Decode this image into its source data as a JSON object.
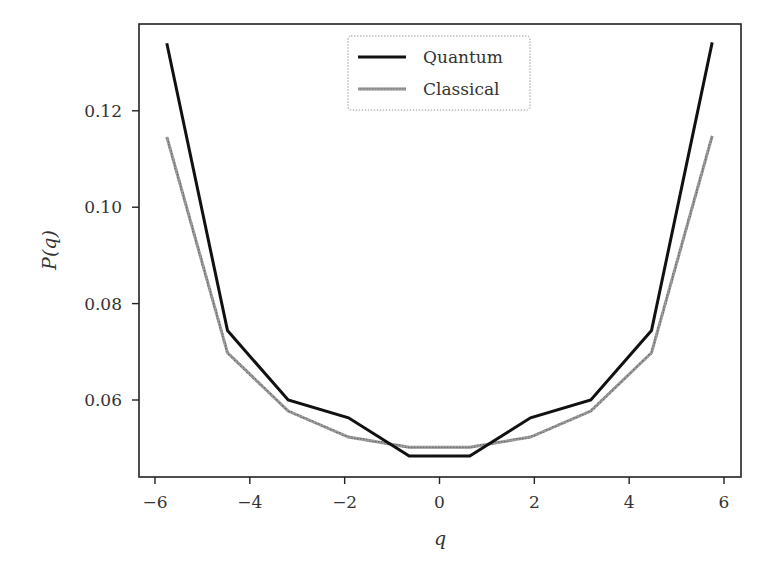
{
  "chart_data": {
    "type": "line",
    "title": "",
    "xlabel": "q",
    "ylabel": "P(q)",
    "xlim": [
      -6.3,
      6.4
    ],
    "ylim": [
      0.0455,
      0.1395
    ],
    "grid": false,
    "legend_position": "upper center",
    "x": [
      -5.75,
      -4.47,
      -3.19,
      -1.92,
      -0.64,
      0.64,
      1.92,
      3.19,
      4.47,
      5.75
    ],
    "series": [
      {
        "name": "Quantum",
        "color": "#111111",
        "style": "solid",
        "values": [
          0.134,
          0.0744,
          0.06,
          0.0563,
          0.0484,
          0.0484,
          0.0563,
          0.06,
          0.0744,
          0.1342
        ]
      },
      {
        "name": "Classical",
        "color": "#888888",
        "style": "hatched-gray",
        "values": [
          0.1146,
          0.0698,
          0.0577,
          0.0523,
          0.0502,
          0.0502,
          0.0523,
          0.0577,
          0.0698,
          0.1148
        ]
      }
    ],
    "x_ticks": [
      {
        "value": -6,
        "label": "−6"
      },
      {
        "value": -4,
        "label": "−4"
      },
      {
        "value": -2,
        "label": "−2"
      },
      {
        "value": 0,
        "label": "0"
      },
      {
        "value": 2,
        "label": "2"
      },
      {
        "value": 4,
        "label": "4"
      },
      {
        "value": 6,
        "label": "6"
      }
    ],
    "y_ticks": [
      {
        "value": 0.06,
        "label": "0.06"
      },
      {
        "value": 0.08,
        "label": "0.08"
      },
      {
        "value": 0.1,
        "label": "0.10"
      },
      {
        "value": 0.12,
        "label": "0.12"
      }
    ],
    "legend": [
      "Quantum",
      "Classical"
    ]
  }
}
